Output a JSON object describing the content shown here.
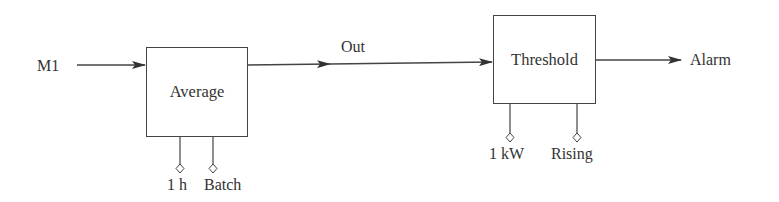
{
  "diagram": {
    "input_label": "M1",
    "blocks": [
      {
        "id": "average",
        "label": "Average",
        "params": [
          "1 h",
          "Batch"
        ]
      },
      {
        "id": "threshold",
        "label": "Threshold",
        "params": [
          "1 kW",
          "Rising"
        ]
      }
    ],
    "connection_label": "Out",
    "output_label": "Alarm"
  },
  "colors": {
    "stroke": "#444444",
    "text": "#333333",
    "background": "#ffffff"
  }
}
